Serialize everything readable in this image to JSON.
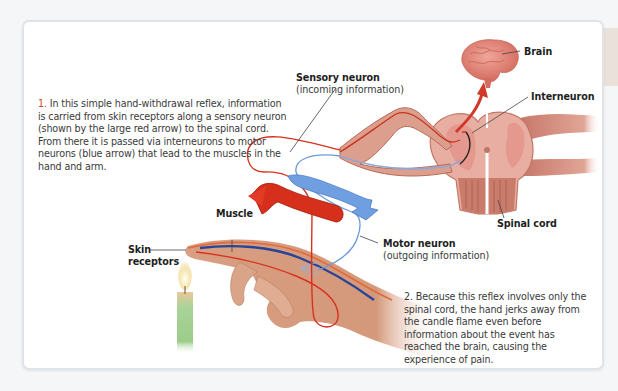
{
  "figure": {
    "title": "Simple hand-withdrawal reflex",
    "captions": [
      {
        "number": "1.",
        "text": "In this simple hand-withdrawal reflex, information is carried from skin receptors along a sensory neuron (shown by the large red arrow) to the spinal cord. From there it is passed via interneurons to motor neurons (blue arrow) that lead to the muscles in the hand and arm."
      },
      {
        "number": "2.",
        "text": "Because this reflex involves only the spinal cord, the hand jerks away from the candle flame even before information about the event has reached the brain, causing the experience of pain."
      }
    ],
    "labels": {
      "brain": "Brain",
      "interneuron": "Interneuron",
      "sensory_neuron": "Sensory neuron",
      "sensory_neuron_sub": "(incoming information)",
      "spinal_cord": "Spinal cord",
      "motor_neuron": "Motor neuron",
      "motor_neuron_sub": "(outgoing information)",
      "muscle": "Muscle",
      "skin_receptors_line1": "Skin",
      "skin_receptors_line2": "receptors"
    },
    "colors": {
      "sensory_red": "#d8321e",
      "motor_blue": "#5a8fd6",
      "tissue_pink": "#e8a89a",
      "tissue_dark": "#b8614e",
      "candle_green": "#9ccc8a",
      "flame": "#f6e6b0"
    }
  }
}
